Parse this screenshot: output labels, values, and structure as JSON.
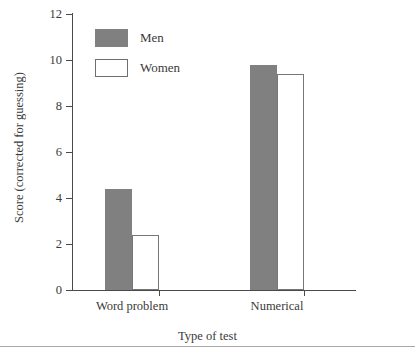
{
  "chart_data": {
    "type": "bar",
    "title": "",
    "xlabel": "Type of test",
    "ylabel": "Score (corrected for guessing)",
    "categories": [
      "Word problem",
      "Numerical"
    ],
    "series": [
      {
        "name": "Men",
        "color": "#808080",
        "values": [
          4.4,
          9.8
        ]
      },
      {
        "name": "Women",
        "color": "#ffffff",
        "values": [
          2.4,
          9.4
        ]
      }
    ],
    "ylim": [
      0,
      12
    ],
    "ytick_values": [
      0,
      2,
      4,
      6,
      8,
      10,
      12
    ],
    "ytick_labels": [
      "0",
      "2",
      "4",
      "6",
      "8",
      "10",
      "12"
    ],
    "grid": false,
    "legend_position": "upper-left-inside"
  },
  "axes": {
    "y_title": "Score (corrected for guessing)",
    "x_title": "Type of test",
    "y_ticks": [
      {
        "label": "12",
        "value": 12
      },
      {
        "label": "10",
        "value": 10
      },
      {
        "label": "8",
        "value": 8
      },
      {
        "label": "6",
        "value": 6
      },
      {
        "label": "4",
        "value": 4
      },
      {
        "label": "2",
        "value": 2
      },
      {
        "label": "0",
        "value": 0
      }
    ],
    "x_categories": [
      {
        "label": "Word problem"
      },
      {
        "label": "Numerical"
      }
    ]
  },
  "legend": {
    "entries": [
      {
        "label": "Men",
        "style": "filled-gray"
      },
      {
        "label": "Women",
        "style": "outlined-white"
      }
    ]
  },
  "colors": {
    "men_fill": "#808080",
    "women_fill": "#ffffff",
    "axis": "#4a4a4a",
    "text": "#3a3a3a",
    "rule": "#a9a9a9"
  }
}
